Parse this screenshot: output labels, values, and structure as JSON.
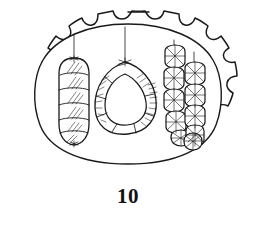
{
  "figure": {
    "caption": "10",
    "background_color": "#ffffff",
    "ink_color": "#1a1a1a",
    "title": ""
  },
  "cell": {
    "outer_wall_label": "scalloped cell wall",
    "inner_membrane_label": "inner membrane",
    "stroke_color": "#1a1a1a"
  },
  "chromosomes": [
    {
      "id": "rod-chromosome",
      "label": "elongated banded chromosome",
      "shape": "rod",
      "bands": 6,
      "thread_label": "spindle thread"
    },
    {
      "id": "ring-chromosome",
      "label": "ring chromosome",
      "shape": "ring",
      "bands": 7,
      "thread_label": "spindle thread"
    },
    {
      "id": "bead-chain-left",
      "label": "beaded chromomere chain",
      "shape": "chain",
      "beads": 5,
      "thread_label": "spindle thread"
    },
    {
      "id": "bead-chain-right",
      "label": "beaded chromomere chain",
      "shape": "chain",
      "beads": 5,
      "thread_label": "spindle thread"
    }
  ]
}
